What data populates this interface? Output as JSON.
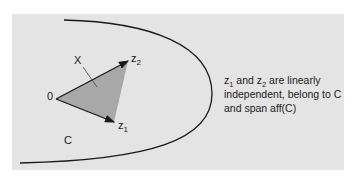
{
  "diagram": {
    "labels": {
      "origin": "0",
      "x": "X",
      "z1_base": "z",
      "z1_sub": "1",
      "z2_base": "z",
      "z2_sub": "2",
      "set": "C"
    },
    "caption": {
      "z1_base": "z",
      "z1_sub": "1",
      "mid": " and ",
      "z2_base": "z",
      "z2_sub": "2",
      "rest_line1": " are linearly",
      "line2": "independent, belong to C",
      "line3": "and span aff(C)"
    },
    "colors": {
      "background": "#e4e4e4",
      "triangle_fill": "#a8a8a8",
      "stroke": "#1a1a1a"
    }
  }
}
